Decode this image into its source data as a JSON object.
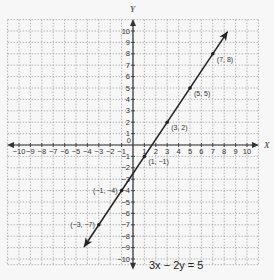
{
  "chart_data": {
    "type": "line",
    "title": "",
    "equation": "3x − 2y = 5",
    "xlabel": "X",
    "ylabel": "Y",
    "xlim": [
      -10,
      10
    ],
    "ylim": [
      -10,
      10
    ],
    "grid": true,
    "x_ticks": [
      -10,
      -9,
      -8,
      -7,
      -6,
      -5,
      -4,
      -3,
      -2,
      -1,
      1,
      2,
      3,
      4,
      5,
      6,
      7,
      8,
      9,
      10
    ],
    "y_ticks": [
      -10,
      -9,
      -8,
      -7,
      -6,
      -5,
      -4,
      -3,
      -2,
      -1,
      1,
      2,
      3,
      4,
      5,
      6,
      7,
      8,
      9,
      10
    ],
    "origin_label": "0",
    "series": [
      {
        "name": "3x − 2y = 5",
        "line_endpoints": [
          [
            -4.3,
            -8.95
          ],
          [
            8.3,
            9.95
          ]
        ],
        "points": [
          {
            "x": -3,
            "y": -7,
            "label": "(−3, −7)"
          },
          {
            "x": -1,
            "y": -4,
            "label": "(−1, −4)"
          },
          {
            "x": 1,
            "y": -1,
            "label": "(1, −1)"
          },
          {
            "x": 3,
            "y": 2,
            "label": "(3, 2)"
          },
          {
            "x": 5,
            "y": 5,
            "label": "(5, 5)"
          },
          {
            "x": 7,
            "y": 8,
            "label": "(7, 8)"
          }
        ]
      }
    ]
  },
  "layout": {
    "origin_px": [
      133,
      145
    ],
    "unit_px": 11.4,
    "colors": {
      "grid": "#9a9a9a",
      "axis": "#333333",
      "line": "#222222",
      "background": "#f7f7f7"
    }
  }
}
